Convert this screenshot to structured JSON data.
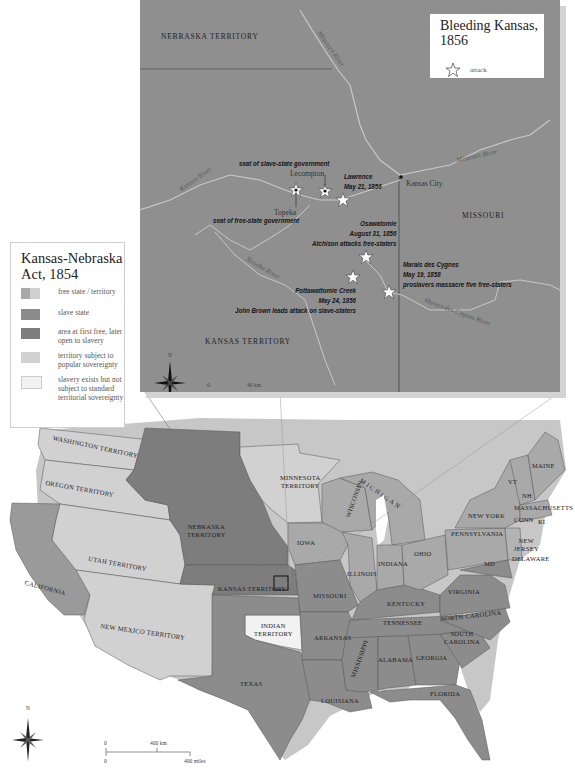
{
  "colors": {
    "free_state": "#a9a9a9",
    "slave_state": "#8c8c8c",
    "free_then_slavery": "#7d7d7d",
    "popular_sovereignty": "#d1d1d1",
    "slavery_not_subject": "#f2f2f2",
    "inset_background": "#8f8f8f",
    "rivers": "#c8c8c8",
    "coast_shadow": "#c4c4c4"
  },
  "inset": {
    "legend": {
      "title_line1": "Bleeding Kansas,",
      "title_line2": "1856",
      "key_icon": "attack-star-icon",
      "key_label": "attack"
    },
    "regions": {
      "nebraska": "NEBRASKA TERRITORY",
      "kansas": "KANSAS TERRITORY",
      "missouri": "MISSOURI"
    },
    "rivers": {
      "missouri_north": "Missouri River",
      "missouri_east": "Missouri River",
      "kansas": "Kansas River",
      "neosho": "Neosho River",
      "marais": "Marais des Cygnes River"
    },
    "cities": {
      "lecompton": "Lecompton",
      "topeka": "Topeka",
      "kansas_city": "Kansas City"
    },
    "events": {
      "slave_gov": "seat of slave-state government",
      "free_gov": "seat of free-state government",
      "lawrence": [
        "Lawrence",
        "May 21, 1856"
      ],
      "osawatomie": [
        "Osawatomie",
        "August 31, 1856",
        "Atchison attacks free-staters"
      ],
      "pottawattomie": [
        "Pottawattomie Creek",
        "May 24, 1856",
        "John Brown leads attack on slave-staters"
      ],
      "marais": [
        "Marais des Cygnes",
        "May 19, 1858",
        "proslavers massacre five free-staters"
      ]
    },
    "compass": "N",
    "scale": {
      "zero_top": "0",
      "km": "40 km",
      "zero_bottom": "0",
      "miles": "40 miles"
    }
  },
  "legend": {
    "title_line1": "Kansas-Nebraska",
    "title_line2": "Act, 1854",
    "items": [
      {
        "label": "free state / territory"
      },
      {
        "label": "slave state"
      },
      {
        "label": "area at first free, later open to slavery"
      },
      {
        "label": "territory subject to popular sovereignty"
      },
      {
        "label": "slavery exists but not subject to standard territorial sovereignty"
      }
    ]
  },
  "main_map": {
    "labels": {
      "washington": "WASHINGTON TERRITORY",
      "oregon": "OREGON TERRITORY",
      "california": "CALIFORNIA",
      "utah": "UTAH TERRITORY",
      "new_mexico": "NEW MEXICO TERRITORY",
      "nebraska_1": "NEBRASKA",
      "nebraska_2": "TERRITORY",
      "kansas": "KANSAS TERRITORY",
      "minnesota_1": "MINNESOTA",
      "minnesota_2": "TERRITORY",
      "iowa": "IOWA",
      "missouri": "MISSOURI",
      "indian_1": "INDIAN",
      "indian_2": "TERRITORY",
      "texas": "TEXAS",
      "arkansas": "ARKANSAS",
      "louisiana": "LOUISIANA",
      "mississippi": "MISSISSIPPI",
      "alabama": "ALABAMA",
      "georgia": "GEORGIA",
      "florida": "FLORIDA",
      "south_carolina_1": "SOUTH",
      "south_carolina_2": "CAROLINA",
      "north_carolina": "NORTH CAROLINA",
      "tennessee": "TENNESSEE",
      "kentucky": "KENTUCKY",
      "virginia": "VIRGINIA",
      "wisconsin": "WISCONSIN",
      "michigan": "MICHIGAN",
      "illinois": "ILLINOIS",
      "indiana": "INDIANA",
      "ohio": "OHIO",
      "pennsylvania": "PENNSYLVANIA",
      "new_york": "NEW YORK",
      "vermont": "VT",
      "new_hampshire": "NH",
      "maine": "MAINE",
      "massachusetts": "MASSACHUSETTS",
      "connecticut": "CONN",
      "rhode_island": "RI",
      "new_jersey_1": "NEW",
      "new_jersey_2": "JERSEY",
      "delaware": "DELAWARE",
      "maryland": "MD"
    },
    "compass": "N",
    "scale": {
      "zero_top": "0",
      "km": "400 km",
      "zero_bottom": "0",
      "miles": "400 miles"
    }
  }
}
